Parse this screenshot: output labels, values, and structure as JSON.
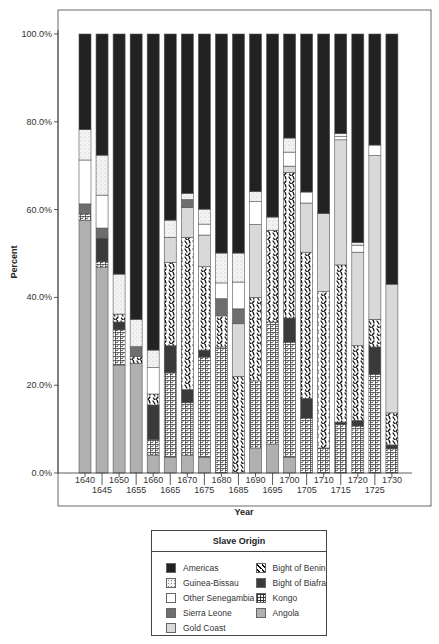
{
  "chart_data": {
    "type": "bar",
    "stacked": true,
    "title": "",
    "xlabel": "Year",
    "ylabel": "Percent",
    "ylim": [
      0,
      100
    ],
    "yticks": [
      "0.0%",
      "20.0%",
      "40.0%",
      "60.0%",
      "80.0%",
      "100.0%"
    ],
    "categories": [
      "1640",
      "1645",
      "1650",
      "1655",
      "1660",
      "1665",
      "1670",
      "1675",
      "1680",
      "1685",
      "1690",
      "1695",
      "1700",
      "1705",
      "1710",
      "1715",
      "1720",
      "1725",
      "1730"
    ],
    "legend_title": "Slave Origin",
    "legend_position": "bottom",
    "series": [
      {
        "name": "Angola",
        "pattern": "solid",
        "color": "#b0b0b0",
        "values": [
          57.6,
          46.9,
          24.6,
          25.0,
          4.1,
          3.6,
          4.0,
          3.6,
          0.0,
          0.0,
          5.7,
          6.6,
          3.6,
          0.0,
          0.0,
          0.0,
          0.0,
          0.0,
          0.0
        ]
      },
      {
        "name": "Kongo",
        "pattern": "grid",
        "color": "#ffffff",
        "values": [
          1.4,
          1.2,
          8.0,
          0.0,
          3.5,
          19.2,
          12.0,
          22.8,
          28.7,
          0.0,
          15.3,
          27.8,
          26.2,
          12.5,
          5.7,
          11.0,
          10.7,
          22.5,
          5.5
        ]
      },
      {
        "name": "Bight of Biafra",
        "pattern": "solid",
        "color": "#3a3a3a",
        "values": [
          0.0,
          5.4,
          1.8,
          0.0,
          7.9,
          6.2,
          3.0,
          1.6,
          0.0,
          0.0,
          0.0,
          0.0,
          5.5,
          4.5,
          0.0,
          0.6,
          1.3,
          6.2,
          0.9
        ]
      },
      {
        "name": "Bight of Benin",
        "pattern": "dashes",
        "color": "#ffffff",
        "values": [
          0.0,
          0.0,
          1.8,
          1.5,
          2.5,
          19.0,
          34.7,
          19.0,
          7.1,
          22.0,
          19.0,
          20.9,
          33.2,
          33.3,
          35.6,
          35.8,
          17.0,
          6.3,
          7.3
        ]
      },
      {
        "name": "Gold Coast",
        "pattern": "solid",
        "color": "#d9d9d9",
        "values": [
          0.0,
          0.0,
          0.0,
          0.0,
          0.0,
          5.7,
          6.8,
          7.2,
          0.0,
          12.0,
          16.6,
          0.0,
          1.4,
          11.2,
          17.8,
          28.5,
          21.3,
          37.3,
          29.3
        ]
      },
      {
        "name": "Sierra Leone",
        "pattern": "solid",
        "color": "#6e6e6e",
        "values": [
          2.3,
          2.3,
          0.0,
          2.3,
          0.0,
          0.0,
          1.8,
          0.0,
          3.9,
          3.4,
          0.0,
          0.0,
          0.0,
          0.0,
          0.0,
          0.0,
          0.0,
          0.0,
          0.0
        ]
      },
      {
        "name": "Other Senegambia",
        "pattern": "solid",
        "color": "#ffffff",
        "values": [
          10.0,
          7.5,
          0.0,
          0.0,
          6.0,
          0.0,
          0.0,
          2.5,
          3.6,
          6.1,
          5.2,
          0.0,
          3.2,
          2.5,
          0.0,
          0.7,
          1.6,
          2.4,
          0.0
        ]
      },
      {
        "name": "Guinea-Bissau",
        "pattern": "dots",
        "color": "#f2f2f2",
        "values": [
          6.9,
          9.1,
          9.1,
          6.2,
          4.0,
          3.9,
          1.4,
          3.4,
          6.8,
          6.6,
          2.3,
          3.0,
          3.2,
          0.0,
          0.0,
          0.7,
          0.6,
          0.0,
          0.0
        ]
      },
      {
        "name": "Americas",
        "pattern": "solid",
        "color": "#222222",
        "values": [
          21.8,
          27.6,
          54.7,
          65.0,
          72.0,
          42.4,
          36.3,
          39.9,
          49.9,
          49.9,
          35.9,
          41.7,
          23.7,
          36.0,
          40.9,
          22.7,
          47.5,
          25.3,
          57.0
        ]
      }
    ],
    "legend_order": {
      "left": [
        "Americas",
        "Guinea-Bissau",
        "Other Senegambia",
        "Sierra Leone",
        "Gold Coast"
      ],
      "right": [
        "Bight of Benin",
        "Bight of Biafra",
        "Kongo",
        "Angola"
      ]
    },
    "grid": false
  }
}
